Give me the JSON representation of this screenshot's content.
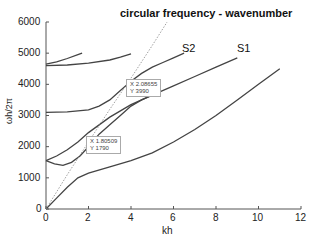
{
  "chart_data": {
    "type": "line",
    "title": "circular frequency - wavenumber",
    "xlabel": "kh",
    "ylabel": "ωh/2π",
    "xlim": [
      0,
      12
    ],
    "ylim": [
      0,
      6000
    ],
    "xticks": [
      "0",
      "2",
      "4",
      "6",
      "8",
      "10",
      "12"
    ],
    "yticks": [
      "0",
      "1000",
      "2000",
      "3000",
      "4000",
      "5000",
      "6000"
    ],
    "grid": false,
    "annotations": [
      {
        "text": "S2",
        "x": 6.6,
        "y": 5050
      },
      {
        "text": "S1",
        "x": 9.3,
        "y": 5050
      }
    ],
    "datatips": [
      {
        "x_label": "X",
        "x_value": "2.08655",
        "y_label": "Y",
        "y_value": "3990"
      },
      {
        "x_label": "X",
        "x_value": "1.80509",
        "y_label": "Y",
        "y_value": "1790"
      }
    ],
    "series": [
      {
        "name": "mode-1",
        "style": "solid",
        "points": [
          [
            0,
            0
          ],
          [
            0.5,
            350
          ],
          [
            1,
            700
          ],
          [
            1.5,
            1000
          ],
          [
            2,
            1150
          ],
          [
            3,
            1350
          ],
          [
            4,
            1550
          ],
          [
            5,
            1800
          ],
          [
            6,
            2150
          ],
          [
            7,
            2550
          ],
          [
            8,
            3000
          ],
          [
            9,
            3500
          ],
          [
            10,
            4000
          ],
          [
            11,
            4500
          ]
        ]
      },
      {
        "name": "S1",
        "style": "solid",
        "points": [
          [
            0,
            1550
          ],
          [
            0.5,
            1700
          ],
          [
            1,
            1900
          ],
          [
            1.5,
            2150
          ],
          [
            2,
            2450
          ],
          [
            3,
            2950
          ],
          [
            4,
            3350
          ],
          [
            5,
            3650
          ],
          [
            6,
            3950
          ],
          [
            7,
            4250
          ],
          [
            8,
            4550
          ],
          [
            9,
            4850
          ]
        ]
      },
      {
        "name": "mode-3",
        "style": "solid",
        "points": [
          [
            0,
            1550
          ],
          [
            0.4,
            1450
          ],
          [
            0.8,
            1400
          ],
          [
            1.2,
            1500
          ],
          [
            1.6,
            1700
          ],
          [
            2,
            2000
          ],
          [
            2.5,
            2400
          ],
          [
            3,
            2700
          ],
          [
            3.5,
            3000
          ],
          [
            4,
            3300
          ],
          [
            4.5,
            3500
          ],
          [
            5,
            3650
          ]
        ]
      },
      {
        "name": "S2",
        "style": "solid",
        "points": [
          [
            0,
            3100
          ],
          [
            1,
            3120
          ],
          [
            2,
            3180
          ],
          [
            2.5,
            3300
          ],
          [
            3,
            3500
          ],
          [
            3.5,
            3800
          ],
          [
            4,
            4100
          ],
          [
            4.5,
            4350
          ],
          [
            5,
            4550
          ],
          [
            5.5,
            4700
          ],
          [
            6,
            4850
          ],
          [
            6.5,
            5000
          ]
        ]
      },
      {
        "name": "mode-5",
        "style": "solid",
        "points": [
          [
            0,
            4600
          ],
          [
            1,
            4620
          ],
          [
            2,
            4680
          ],
          [
            3,
            4780
          ],
          [
            3.5,
            4870
          ],
          [
            4,
            4980
          ]
        ]
      },
      {
        "name": "mode-6",
        "style": "solid",
        "points": [
          [
            0,
            4650
          ],
          [
            0.5,
            4720
          ],
          [
            1,
            4830
          ],
          [
            1.5,
            4950
          ],
          [
            1.7,
            5000
          ]
        ]
      },
      {
        "name": "light-line",
        "style": "dotted",
        "points": [
          [
            0,
            0
          ],
          [
            1,
            1100
          ],
          [
            2,
            2150
          ],
          [
            3,
            3200
          ],
          [
            4,
            4200
          ],
          [
            5,
            5250
          ],
          [
            5.7,
            6000
          ]
        ]
      }
    ]
  },
  "labels": {
    "title": "circular frequency - wavenumber",
    "xlabel": "kh",
    "ylabel": "ωh/2π",
    "s1": "S1",
    "s2": "S2",
    "tip1_x": "X 2.08655",
    "tip1_y": "Y 3990",
    "tip2_x": "X 1.80509",
    "tip2_y": "Y 1790",
    "xt0": "0",
    "xt1": "2",
    "xt2": "4",
    "xt3": "6",
    "xt4": "8",
    "xt5": "10",
    "xt6": "12",
    "yt0": "0",
    "yt1": "1000",
    "yt2": "2000",
    "yt3": "3000",
    "yt4": "4000",
    "yt5": "5000",
    "yt6": "6000"
  }
}
